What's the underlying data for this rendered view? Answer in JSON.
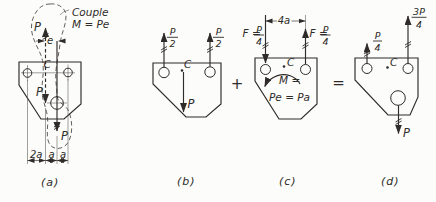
{
  "figure": {
    "colors": {
      "ink": "#2e2b28",
      "paper": "#fcfcfa"
    },
    "operators": {
      "plus": "+",
      "equals": "="
    },
    "panels": {
      "a": {
        "caption": "(a)",
        "couple_line1": "Couple",
        "couple_line2": "M = Pe",
        "force_top": "P",
        "dim_e": "e",
        "centroid": "C",
        "force_center": "P",
        "force_hole": "P",
        "dim_2a": "2a",
        "dim_a1": "a",
        "dim_a2": "a"
      },
      "b": {
        "caption": "(b)",
        "force_left": {
          "num": "P",
          "den": "2"
        },
        "force_right": {
          "num": "P",
          "den": "2"
        },
        "centroid": "C",
        "force_down": "P"
      },
      "c": {
        "caption": "(c)",
        "dim_4a": "4a",
        "force_left_label": "F =",
        "force_left": {
          "num": "P",
          "den": "4"
        },
        "force_right_label": "F =",
        "force_right": {
          "num": "P",
          "den": "4"
        },
        "centroid": "C",
        "moment_label": "M =",
        "moment_value": "Pe = Pa"
      },
      "d": {
        "caption": "(d)",
        "force_left": {
          "num": "P",
          "den": "4"
        },
        "force_right": {
          "num": "3P",
          "den": "4"
        },
        "centroid": "C",
        "force_down": "P"
      }
    }
  }
}
